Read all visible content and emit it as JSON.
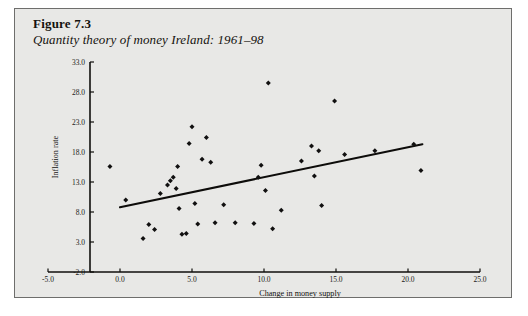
{
  "figure": {
    "number": "Figure 7.3",
    "subtitle": "Quantity theory of money Ireland: 1961–98"
  },
  "colors": {
    "card_background": "#e8e8e6",
    "card_border": "#6e6e6c",
    "ink": "#111010",
    "page_background": "#ffffff"
  },
  "chart_data": {
    "type": "scatter",
    "title": "Quantity theory of money Ireland: 1961–98",
    "xlabel": "Change in money supply",
    "ylabel": "Inflation rate",
    "xlim": [
      -5.0,
      25.0
    ],
    "ylim": [
      -2.0,
      33.0
    ],
    "xticks": [
      "-5.0",
      "0.0",
      "5.0",
      "10.0",
      "15.0",
      "20.0",
      "25.0"
    ],
    "yticks": [
      "-2.0",
      "3.0",
      "8.0",
      "13.0",
      "18.0",
      "23.0",
      "28.0",
      "33.0"
    ],
    "xtick_values": [
      -5.0,
      0.0,
      5.0,
      10.0,
      15.0,
      20.0,
      25.0
    ],
    "ytick_values": [
      -2.0,
      3.0,
      8.0,
      13.0,
      18.0,
      23.0,
      28.0,
      33.0
    ],
    "grid": false,
    "legend": null,
    "marker": "diamond",
    "points": [
      {
        "x": -0.7,
        "y": 15.6
      },
      {
        "x": 0.4,
        "y": 10.0
      },
      {
        "x": 1.6,
        "y": 3.6
      },
      {
        "x": 2.0,
        "y": 5.9
      },
      {
        "x": 2.4,
        "y": 5.1
      },
      {
        "x": 2.8,
        "y": 11.1
      },
      {
        "x": 3.3,
        "y": 12.5
      },
      {
        "x": 3.5,
        "y": 13.2
      },
      {
        "x": 3.7,
        "y": 13.8
      },
      {
        "x": 3.9,
        "y": 11.9
      },
      {
        "x": 4.0,
        "y": 15.6
      },
      {
        "x": 4.1,
        "y": 8.6
      },
      {
        "x": 4.3,
        "y": 4.3
      },
      {
        "x": 4.6,
        "y": 4.4
      },
      {
        "x": 4.8,
        "y": 19.4
      },
      {
        "x": 5.0,
        "y": 22.2
      },
      {
        "x": 5.2,
        "y": 9.4
      },
      {
        "x": 5.4,
        "y": 6.0
      },
      {
        "x": 5.7,
        "y": 16.8
      },
      {
        "x": 6.0,
        "y": 20.4
      },
      {
        "x": 6.3,
        "y": 16.3
      },
      {
        "x": 6.6,
        "y": 6.2
      },
      {
        "x": 7.2,
        "y": 9.2
      },
      {
        "x": 8.0,
        "y": 6.2
      },
      {
        "x": 9.3,
        "y": 6.1
      },
      {
        "x": 9.6,
        "y": 13.8
      },
      {
        "x": 9.8,
        "y": 15.8
      },
      {
        "x": 10.1,
        "y": 11.6
      },
      {
        "x": 10.3,
        "y": 29.5
      },
      {
        "x": 10.6,
        "y": 5.2
      },
      {
        "x": 11.2,
        "y": 8.3
      },
      {
        "x": 12.6,
        "y": 16.5
      },
      {
        "x": 13.3,
        "y": 19.0
      },
      {
        "x": 13.5,
        "y": 14.0
      },
      {
        "x": 13.8,
        "y": 18.2
      },
      {
        "x": 14.0,
        "y": 9.1
      },
      {
        "x": 14.9,
        "y": 26.5
      },
      {
        "x": 15.6,
        "y": 17.6
      },
      {
        "x": 17.7,
        "y": 18.2
      },
      {
        "x": 20.4,
        "y": 19.3
      },
      {
        "x": 20.9,
        "y": 14.9
      }
    ],
    "trend_line": {
      "label": "linear fit",
      "x0": 0.0,
      "y0": 8.8,
      "x1": 21.0,
      "y1": 19.3
    }
  }
}
